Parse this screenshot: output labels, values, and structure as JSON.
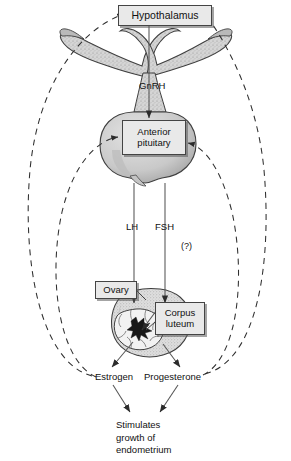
{
  "diagram": {
    "type": "biology-flow-diagram",
    "boxes": [
      {
        "id": "hypothalamus",
        "label": "Hypothalamus"
      },
      {
        "id": "anterior_pituitary",
        "label": "Anterior\npituitary"
      },
      {
        "id": "ovary",
        "label": "Ovary"
      },
      {
        "id": "corpus_luteum",
        "label": "Corpus\nluteum"
      }
    ],
    "labels": {
      "gnrh": "GnRH",
      "lh": "LH",
      "fsh": "FSH",
      "question": "(?)",
      "estrogen": "Estrogen",
      "progesterone": "Progesterone",
      "endometrium": "Stimulates\ngrowth of\nendometrium"
    },
    "flows": [
      {
        "from": "Hypothalamus",
        "to": "Anterior pituitary",
        "label": "GnRH",
        "style": "solid-arrow"
      },
      {
        "from": "Anterior pituitary",
        "to": "Ovary",
        "label": "LH",
        "style": "solid-arrow"
      },
      {
        "from": "Anterior pituitary",
        "to": "Corpus luteum",
        "label": "FSH",
        "style": "solid-arrow",
        "note": "(?)"
      },
      {
        "from": "Ovary",
        "to": "Estrogen",
        "style": "solid-arrow"
      },
      {
        "from": "Corpus luteum",
        "to": "Progesterone",
        "style": "solid-arrow"
      },
      {
        "from": "Estrogen",
        "to": "Stimulates growth of endometrium",
        "style": "solid-arrow"
      },
      {
        "from": "Progesterone",
        "to": "Stimulates growth of endometrium",
        "style": "solid-arrow"
      },
      {
        "from": "Estrogen",
        "to": "Hypothalamus",
        "style": "dashed-feedback"
      },
      {
        "from": "Estrogen",
        "to": "Anterior pituitary",
        "style": "dashed-feedback"
      },
      {
        "from": "Progesterone",
        "to": "Hypothalamus",
        "style": "dashed-feedback"
      },
      {
        "from": "Progesterone",
        "to": "Anterior pituitary",
        "style": "dashed-feedback"
      }
    ],
    "anatomy": [
      {
        "id": "hypothalamus-organ",
        "shape": "winged stippled gray structure"
      },
      {
        "id": "pituitary-stalk",
        "shape": "vertical stippled stalk"
      },
      {
        "id": "pituitary-gland",
        "shape": "rounded bilobed stippled gland"
      },
      {
        "id": "ovary-organ",
        "shape": "stippled oval ovary"
      },
      {
        "id": "corpus-luteum-body",
        "shape": "lobed pale body with dark star center"
      }
    ],
    "colors": {
      "ink": "#111111",
      "organ_fill": "#d2d2d2",
      "organ_stroke": "#3a3a3a",
      "box_fill": "#e9e9e9",
      "box_stroke": "#444444",
      "background": "#ffffff"
    }
  }
}
